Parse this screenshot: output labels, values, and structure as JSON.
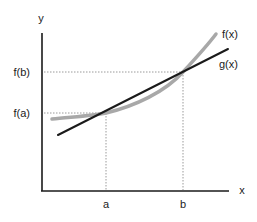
{
  "diagram": {
    "axes": {
      "x_label": "x",
      "y_label": "y"
    },
    "x_ticks": [
      {
        "label": "a",
        "x": 106
      },
      {
        "label": "b",
        "x": 183
      }
    ],
    "y_ticks": [
      {
        "label": "f(a)",
        "y": 113
      },
      {
        "label": "f(b)",
        "y": 72
      }
    ],
    "curves": [
      {
        "name": "f(x)",
        "label": "f(x)",
        "color": "#a8a8a8",
        "style": "thick curve"
      },
      {
        "name": "g(x)",
        "label": "g(x)",
        "color": "#1a1a1a",
        "style": "straight line"
      }
    ],
    "colors": {
      "axis": "#1a1a1a",
      "guide": "#9a9a9a",
      "curve_f": "#a8a8a8",
      "line_g": "#1a1a1a"
    }
  }
}
